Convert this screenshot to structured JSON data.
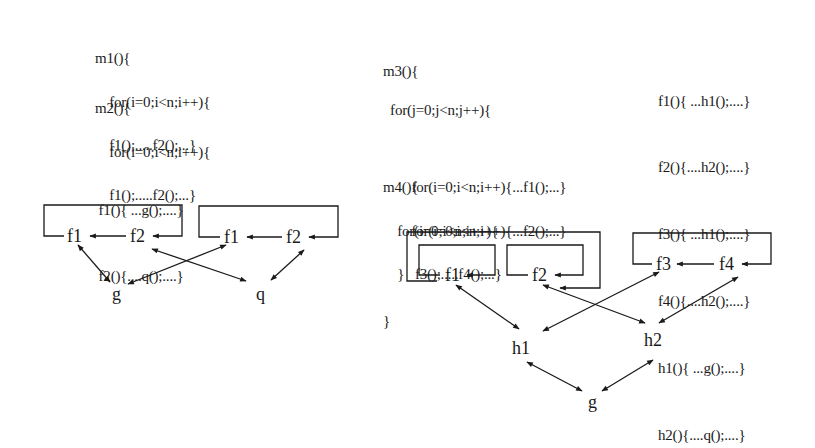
{
  "left_panel": {
    "code_m1": [
      "m1(){",
      "    for(i=0;i<n;i++){",
      "    f1();.....f2();...}"
    ],
    "code_m2": [
      "m2(){",
      "    for(i=0;i<n;i++){",
      "    f1();.....f2();...}"
    ],
    "code_f": [
      " f1(){ ...g();....}",
      " f2(){....q();....}"
    ],
    "nodes": {
      "a_f1": "f1",
      "a_f2": "f2",
      "b_f1": "f1",
      "b_f2": "f2",
      "g": "g",
      "q": "q"
    }
  },
  "right_panel": {
    "code_m3": [
      "m3(){",
      "  for(j=0;j<n;j++){",
      "",
      "        for(i=0;i<n;i++){...f1();...}",
      "        for(i=0;i<n;i++){...f2();...}",
      "    }",
      "}"
    ],
    "code_m4": [
      "m4(){",
      "    for(i=0;i<n;i++){",
      "         f3();.....f4();...}"
    ],
    "code_defs": [
      "f1(){ ...h1();....}",
      "f2(){....h2();....}",
      "f3(){ ...h1();....}",
      "f4(){....h2();....}",
      "h1(){ ...g();....}",
      "h2(){....q();....}"
    ],
    "nodes": {
      "f1": "f1",
      "f2": "f2",
      "f3": "f3",
      "f4": "f4",
      "h1": "h1",
      "h2": "h2",
      "g": "g"
    }
  },
  "colors": {
    "ink": "#1a1a1a",
    "background": "#ffffff"
  }
}
